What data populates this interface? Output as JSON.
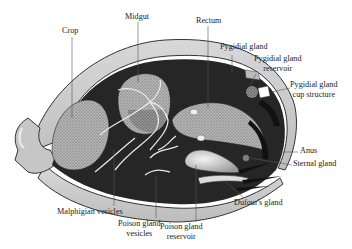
{
  "diagram": {
    "colors": {
      "shell": "#c9c9c9",
      "shell_outline": "#333333",
      "cavity": "#2a2a2a",
      "organ_stipple": "#a8a8a8",
      "poison_reservoir": "#dcdcdc",
      "background": "#ffffff"
    },
    "labels": [
      {
        "id": "crop",
        "text": "Crop"
      },
      {
        "id": "midgut",
        "text": "Midgut"
      },
      {
        "id": "rectum",
        "text": "Rectum"
      },
      {
        "id": "pygidial-gland",
        "text": "Pygidial gland"
      },
      {
        "id": "pygidial-gland-reservoir",
        "line1": "Pygidial gland",
        "line2": "reservoir"
      },
      {
        "id": "pygidial-gland-cup-structure",
        "line1": "Pygidial gland",
        "line2": "cup structure"
      },
      {
        "id": "anus",
        "text": "Anus"
      },
      {
        "id": "sternal-gland",
        "text": "Sternal gland"
      },
      {
        "id": "dufours-gland",
        "text": "Dufour's gland"
      },
      {
        "id": "malphigian-vesicles",
        "text": "Malphigian vesicles"
      },
      {
        "id": "poison-gland-vesicles",
        "line1": "Poison gland",
        "line2": "vesicles"
      },
      {
        "id": "poison-gland-reservoir",
        "line1": "Poison gland",
        "line2": "reservoir"
      }
    ]
  }
}
